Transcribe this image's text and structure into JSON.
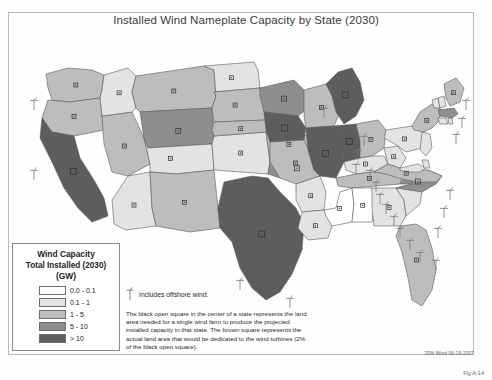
{
  "figure": {
    "title": "Installed Wind Nameplate Capacity by State (2030)",
    "number": "Fig A-14",
    "source_note": "20% Wind 06-19-2007"
  },
  "legend": {
    "title_line1": "Wind Capacity",
    "title_line2": "Total Installed (2030)",
    "title_line3": "(GW)",
    "classes": [
      {
        "label": "0.0 - 0.1",
        "color": "#ffffff"
      },
      {
        "label": "0.1 - 1",
        "color": "#e3e3e3"
      },
      {
        "label": "1 - 5",
        "color": "#bdbdbd"
      },
      {
        "label": "5 - 10",
        "color": "#8e8e8e"
      },
      {
        "label": "> 10",
        "color": "#5d5d5d"
      }
    ]
  },
  "notes": {
    "offshore": "Includes offshore wind.",
    "explanation": "The black open square in the center of a state represents the land area needed for a single wind farm to produce the projected installed capacity in that state. The brown square represents the actual land area that would be dedicated to the wind turbines (2% of the black open square)."
  },
  "chart_data": {
    "type": "map",
    "title": "Installed Wind Nameplate Capacity by State (2030)",
    "unit": "GW",
    "value_bins": [
      "0.0 - 0.1",
      "0.1 - 1",
      "1 - 5",
      "5 - 10",
      "> 10"
    ],
    "bin_colors": [
      "#ffffff",
      "#e3e3e3",
      "#bdbdbd",
      "#8e8e8e",
      "#5d5d5d"
    ],
    "legend_position": "bottom-left",
    "offshore_marker": "wind-turbine-symbol",
    "states": [
      {
        "code": "WA",
        "name": "Washington",
        "bin": "1 - 5",
        "offshore": true
      },
      {
        "code": "OR",
        "name": "Oregon",
        "bin": "1 - 5",
        "offshore": true
      },
      {
        "code": "CA",
        "name": "California",
        "bin": "> 10",
        "offshore": true
      },
      {
        "code": "NV",
        "name": "Nevada",
        "bin": "1 - 5",
        "offshore": false
      },
      {
        "code": "ID",
        "name": "Idaho",
        "bin": "0.1 - 1",
        "offshore": false
      },
      {
        "code": "MT",
        "name": "Montana",
        "bin": "1 - 5",
        "offshore": false
      },
      {
        "code": "WY",
        "name": "Wyoming",
        "bin": "5 - 10",
        "offshore": false
      },
      {
        "code": "UT",
        "name": "Utah",
        "bin": "0.1 - 1",
        "offshore": false
      },
      {
        "code": "AZ",
        "name": "Arizona",
        "bin": "0.1 - 1",
        "offshore": false
      },
      {
        "code": "NM",
        "name": "New Mexico",
        "bin": "1 - 5",
        "offshore": false
      },
      {
        "code": "CO",
        "name": "Colorado",
        "bin": "0.1 - 1",
        "offshore": false
      },
      {
        "code": "ND",
        "name": "North Dakota",
        "bin": "0.1 - 1",
        "offshore": false
      },
      {
        "code": "SD",
        "name": "South Dakota",
        "bin": "1 - 5",
        "offshore": false
      },
      {
        "code": "NE",
        "name": "Nebraska",
        "bin": "1 - 5",
        "offshore": false
      },
      {
        "code": "KS",
        "name": "Kansas",
        "bin": "1 - 5",
        "offshore": false
      },
      {
        "code": "OK",
        "name": "Oklahoma",
        "bin": "5 - 10",
        "offshore": false
      },
      {
        "code": "TX",
        "name": "Texas",
        "bin": "> 10",
        "offshore": true
      },
      {
        "code": "MN",
        "name": "Minnesota",
        "bin": "5 - 10",
        "offshore": false
      },
      {
        "code": "IA",
        "name": "Iowa",
        "bin": "> 10",
        "offshore": false
      },
      {
        "code": "MO",
        "name": "Missouri",
        "bin": "1 - 5",
        "offshore": false
      },
      {
        "code": "AR",
        "name": "Arkansas",
        "bin": "0.1 - 1",
        "offshore": false
      },
      {
        "code": "LA",
        "name": "Louisiana",
        "bin": "0.1 - 1",
        "offshore": false
      },
      {
        "code": "WI",
        "name": "Wisconsin",
        "bin": "1 - 5",
        "offshore": false
      },
      {
        "code": "IL",
        "name": "Illinois",
        "bin": "> 10",
        "offshore": false
      },
      {
        "code": "MI",
        "name": "Michigan",
        "bin": "> 10",
        "offshore": true
      },
      {
        "code": "IN",
        "name": "Indiana",
        "bin": "> 10",
        "offshore": false
      },
      {
        "code": "OH",
        "name": "Ohio",
        "bin": "1 - 5",
        "offshore": false
      },
      {
        "code": "KY",
        "name": "Kentucky",
        "bin": "0.1 - 1",
        "offshore": false
      },
      {
        "code": "TN",
        "name": "Tennessee",
        "bin": "1 - 5",
        "offshore": false
      },
      {
        "code": "MS",
        "name": "Mississippi",
        "bin": "0.0 - 0.1",
        "offshore": false
      },
      {
        "code": "AL",
        "name": "Alabama",
        "bin": "0.0 - 0.1",
        "offshore": false
      },
      {
        "code": "GA",
        "name": "Georgia",
        "bin": "0.1 - 1",
        "offshore": true
      },
      {
        "code": "FL",
        "name": "Florida",
        "bin": "1 - 5",
        "offshore": true
      },
      {
        "code": "SC",
        "name": "South Carolina",
        "bin": "0.1 - 1",
        "offshore": true
      },
      {
        "code": "NC",
        "name": "North Carolina",
        "bin": "5 - 10",
        "offshore": true
      },
      {
        "code": "VA",
        "name": "Virginia",
        "bin": "1 - 5",
        "offshore": true
      },
      {
        "code": "WV",
        "name": "West Virginia",
        "bin": "0.1 - 1",
        "offshore": false
      },
      {
        "code": "MD",
        "name": "Maryland",
        "bin": "0.1 - 1",
        "offshore": true
      },
      {
        "code": "DE",
        "name": "Delaware",
        "bin": "0.1 - 1",
        "offshore": true
      },
      {
        "code": "PA",
        "name": "Pennsylvania",
        "bin": "0.1 - 1",
        "offshore": false
      },
      {
        "code": "NJ",
        "name": "New Jersey",
        "bin": "0.1 - 1",
        "offshore": true
      },
      {
        "code": "NY",
        "name": "New York",
        "bin": "1 - 5",
        "offshore": true
      },
      {
        "code": "CT",
        "name": "Connecticut",
        "bin": "0.1 - 1",
        "offshore": true
      },
      {
        "code": "RI",
        "name": "Rhode Island",
        "bin": "0.1 - 1",
        "offshore": true
      },
      {
        "code": "MA",
        "name": "Massachusetts",
        "bin": "5 - 10",
        "offshore": true
      },
      {
        "code": "VT",
        "name": "Vermont",
        "bin": "0.1 - 1",
        "offshore": false
      },
      {
        "code": "NH",
        "name": "New Hampshire",
        "bin": "0.1 - 1",
        "offshore": true
      },
      {
        "code": "ME",
        "name": "Maine",
        "bin": "1 - 5",
        "offshore": true
      }
    ]
  }
}
